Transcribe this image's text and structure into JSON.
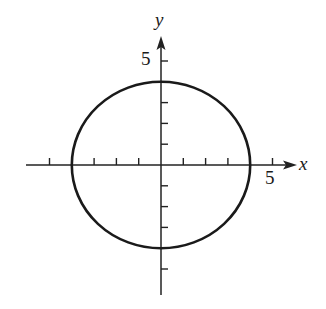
{
  "chart_data": {
    "type": "line",
    "title": "",
    "xlabel": "x",
    "ylabel": "y",
    "xlim": [
      -6,
      6
    ],
    "ylim": [
      -6,
      6
    ],
    "grid": false,
    "legend": null,
    "x_ticks": [
      -5,
      -4,
      -3,
      -2,
      -1,
      1,
      2,
      3,
      4,
      5
    ],
    "y_ticks": [
      -5,
      -4,
      -3,
      -2,
      -1,
      1,
      2,
      3,
      4,
      5
    ],
    "x_tick_labels": [
      {
        "value": 5,
        "text": "5"
      }
    ],
    "y_tick_labels": [
      {
        "value": 5,
        "text": "5"
      }
    ],
    "series": [
      {
        "name": "circle",
        "shape": "ellipse",
        "center": [
          0,
          0
        ],
        "radius_x": 4,
        "radius_y": 4,
        "equation": "x^2 + y^2 = 16",
        "color": "#1a1a1a"
      }
    ]
  },
  "labels": {
    "x_axis": "x",
    "y_axis": "y",
    "x_tick_5": "5",
    "y_tick_5": "5"
  },
  "colors": {
    "axis": "#222222",
    "curve": "#1a1a1a",
    "background": "#ffffff"
  }
}
